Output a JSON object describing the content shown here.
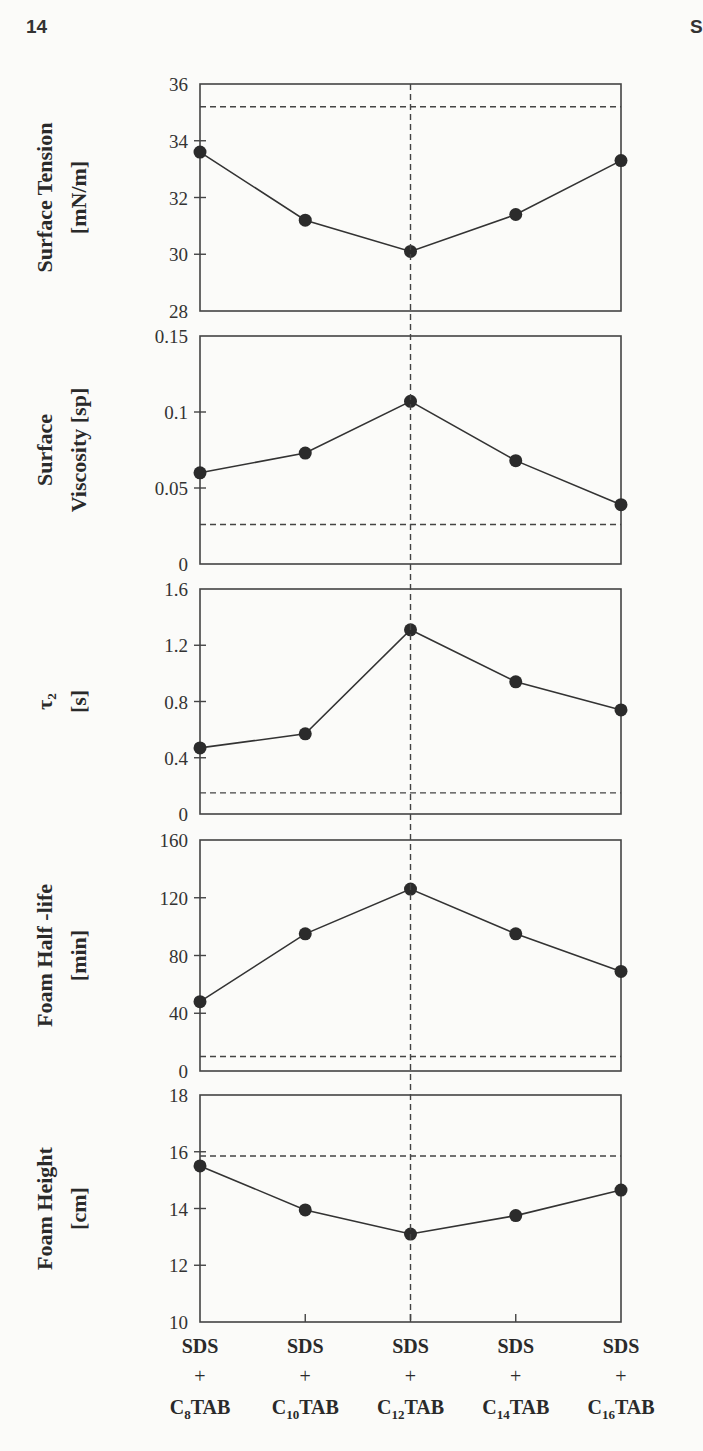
{
  "page": {
    "page_number": "14",
    "header_fragment": "S"
  },
  "figure": {
    "categories": [
      "SDS + C8TAB",
      "SDS + C10TAB",
      "SDS + C12TAB",
      "SDS + C14TAB",
      "SDS + C16TAB"
    ],
    "category_parts": [
      {
        "top": "SDS",
        "mid": "+",
        "base": "C",
        "sub": "8",
        "tail": "TAB"
      },
      {
        "top": "SDS",
        "mid": "+",
        "base": "C",
        "sub": "10",
        "tail": "TAB"
      },
      {
        "top": "SDS",
        "mid": "+",
        "base": "C",
        "sub": "12",
        "tail": "TAB"
      },
      {
        "top": "SDS",
        "mid": "+",
        "base": "C",
        "sub": "14",
        "tail": "TAB"
      },
      {
        "top": "SDS",
        "mid": "+",
        "base": "C",
        "sub": "16",
        "tail": "TAB"
      }
    ],
    "vertical_reference_category": "SDS + C12TAB",
    "colors": {
      "line": "#333333",
      "marker": "#2b2b2b",
      "frame": "#444444",
      "dashed": "#444444"
    }
  },
  "chart_data": [
    {
      "type": "line",
      "title": "",
      "ylabel_lines": [
        "Surface Tension",
        "[mN/m]"
      ],
      "categories": [
        "SDS + C8TAB",
        "SDS + C10TAB",
        "SDS + C12TAB",
        "SDS + C14TAB",
        "SDS + C16TAB"
      ],
      "values": [
        33.6,
        31.2,
        30.1,
        31.4,
        33.3
      ],
      "ylim": [
        28,
        36
      ],
      "yticks": [
        28,
        30,
        32,
        34,
        36
      ],
      "ytick_labels": [
        "28",
        "30",
        "32",
        "34",
        "36"
      ],
      "reference_line": 35.2,
      "grid": false
    },
    {
      "type": "line",
      "title": "",
      "ylabel_lines": [
        "Surface",
        "Viscosity [sp]"
      ],
      "categories": [
        "SDS + C8TAB",
        "SDS + C10TAB",
        "SDS + C12TAB",
        "SDS + C14TAB",
        "SDS + C16TAB"
      ],
      "values": [
        0.06,
        0.073,
        0.107,
        0.068,
        0.039
      ],
      "ylim": [
        0,
        0.15
      ],
      "yticks": [
        0,
        0.05,
        0.1,
        0.15
      ],
      "ytick_labels": [
        "0",
        "0.05",
        "0.1",
        "0.15"
      ],
      "reference_line": 0.026,
      "grid": false
    },
    {
      "type": "line",
      "title": "",
      "ylabel_lines": [
        "τ₂",
        "[s]"
      ],
      "categories": [
        "SDS + C8TAB",
        "SDS + C10TAB",
        "SDS + C12TAB",
        "SDS + C14TAB",
        "SDS + C16TAB"
      ],
      "values": [
        0.47,
        0.57,
        1.31,
        0.94,
        0.74
      ],
      "ylim": [
        0,
        1.6
      ],
      "yticks": [
        0,
        0.4,
        0.8,
        1.2,
        1.6
      ],
      "ytick_labels": [
        "0",
        "0.4",
        "0.8",
        "1.2",
        "1.6"
      ],
      "reference_line": 0.15,
      "grid": false
    },
    {
      "type": "line",
      "title": "",
      "ylabel_lines": [
        "Foam Half -life",
        "[min]"
      ],
      "categories": [
        "SDS + C8TAB",
        "SDS + C10TAB",
        "SDS + C12TAB",
        "SDS + C14TAB",
        "SDS + C16TAB"
      ],
      "values": [
        48,
        95,
        126,
        95,
        69
      ],
      "ylim": [
        0,
        160
      ],
      "yticks": [
        0,
        40,
        80,
        120,
        160
      ],
      "ytick_labels": [
        "0",
        "40",
        "80",
        "120",
        "160"
      ],
      "reference_line": 10,
      "grid": false
    },
    {
      "type": "line",
      "title": "",
      "ylabel_lines": [
        "Foam Height",
        "[cm]"
      ],
      "categories": [
        "SDS + C8TAB",
        "SDS + C10TAB",
        "SDS + C12TAB",
        "SDS + C14TAB",
        "SDS + C16TAB"
      ],
      "values": [
        15.5,
        13.95,
        13.1,
        13.75,
        14.65
      ],
      "ylim": [
        10,
        18
      ],
      "yticks": [
        10,
        12,
        14,
        16,
        18
      ],
      "ytick_labels": [
        "10",
        "12",
        "14",
        "16",
        "18"
      ],
      "reference_line": 15.85,
      "grid": false
    }
  ]
}
